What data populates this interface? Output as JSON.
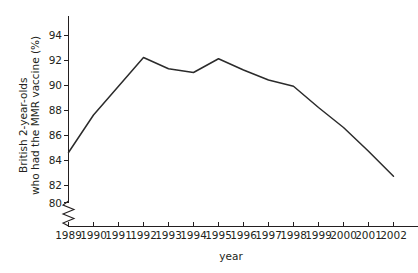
{
  "chart_data": {
    "type": "line",
    "title": "",
    "xlabel": "year",
    "ylabel": "British 2-year-olds who had the MMR vaccine (%)",
    "ylabel_line1": "British 2-year-olds",
    "ylabel_line2": "who had the MMR vaccine (%)",
    "categories": [
      "1989",
      "1990",
      "1991",
      "1992",
      "1993",
      "1994",
      "1995",
      "1996",
      "1997",
      "1998",
      "1999",
      "2000",
      "2001",
      "2002"
    ],
    "x": [
      1989,
      1990,
      1991,
      1992,
      1993,
      1994,
      1995,
      1996,
      1997,
      1998,
      1999,
      2000,
      2001,
      2002
    ],
    "values": [
      84.0,
      87.0,
      89.3,
      91.6,
      90.7,
      90.4,
      91.5,
      90.6,
      89.8,
      89.3,
      87.6,
      86.0,
      84.1,
      82.1
    ],
    "series": [
      {
        "name": "MMR vaccine uptake",
        "values": [
          84.0,
          87.0,
          89.3,
          91.6,
          90.7,
          90.4,
          91.5,
          90.6,
          89.8,
          89.3,
          87.6,
          86.0,
          84.1,
          82.1
        ],
        "color": "#2b2b2b"
      }
    ],
    "ylim": [
      80,
      95
    ],
    "yticks": [
      80,
      82,
      84,
      86,
      88,
      90,
      92,
      94
    ],
    "ytick_labels": [
      "80",
      "82",
      "84",
      "86",
      "88",
      "90",
      "92",
      "94"
    ],
    "xlim": [
      1989,
      2002
    ],
    "grid": false,
    "legend": false,
    "axis_break": {
      "axis": "y",
      "style": "zigzag",
      "below_value": 80,
      "label": "y-axis-break"
    },
    "line_color": "#2b2b2b",
    "axis_color": "#231f20"
  }
}
